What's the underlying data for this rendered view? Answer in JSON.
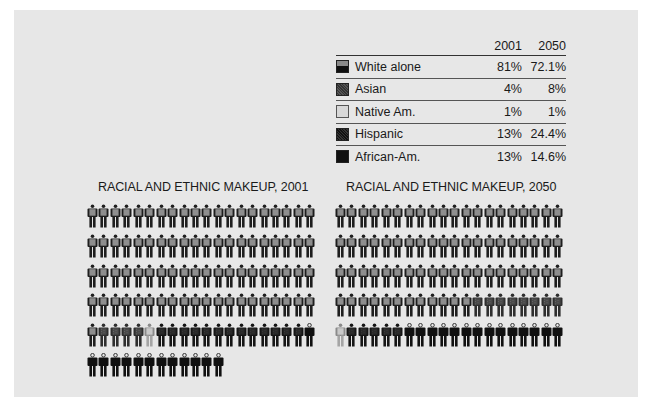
{
  "legend": {
    "columns": [
      "2001",
      "2050"
    ],
    "rows": [
      {
        "key": "white",
        "label": "White alone",
        "v2001": "81%",
        "v2050": "72.1%"
      },
      {
        "key": "asian",
        "label": "Asian",
        "v2001": "4%",
        "v2050": "8%"
      },
      {
        "key": "native",
        "label": "Native Am.",
        "v2001": "1%",
        "v2050": "1%"
      },
      {
        "key": "hispanic",
        "label": "Hispanic",
        "v2001": "13%",
        "v2050": "24.4%"
      },
      {
        "key": "african",
        "label": "African-Am.",
        "v2001": "13%",
        "v2050": "14.6%"
      }
    ]
  },
  "charts": {
    "c2001": {
      "title": "RACIAL AND ETHNIC MAKEUP, 2001"
    },
    "c2050": {
      "title": "RACIAL AND ETHNIC MAKEUP, 2050"
    }
  },
  "colors": {
    "panel": "#e7e7e7",
    "white_torso": "#8e8e8e",
    "white_body": "#1e1e1e",
    "asian": "#4a4a4a",
    "native": "#c9c9c9",
    "hispanic": "#2a2a2a",
    "african": "#111111"
  },
  "chart_data": [
    {
      "type": "pictograph",
      "title": "RACIAL AND ETHNIC MAKEUP, 2001",
      "unit": "1 figure = 1%",
      "figures_per_row": 20,
      "categories": [
        "White alone",
        "Asian",
        "Native Am.",
        "Hispanic",
        "African-Am."
      ],
      "values": [
        81,
        4,
        1,
        13,
        13
      ],
      "sequence": [
        {
          "category": "White alone",
          "count": 81
        },
        {
          "category": "Asian",
          "count": 4
        },
        {
          "category": "Native Am.",
          "count": 1
        },
        {
          "category": "Hispanic",
          "count": 13
        },
        {
          "category": "African-Am.",
          "count": 13
        }
      ]
    },
    {
      "type": "pictograph",
      "title": "RACIAL AND ETHNIC MAKEUP, 2050",
      "unit": "1 figure = 1%",
      "figures_per_row": 20,
      "categories": [
        "White alone",
        "Asian",
        "Native Am.",
        "Hispanic",
        "African-Am."
      ],
      "values": [
        72.1,
        8,
        1,
        24.4,
        14.6
      ],
      "sequence": [
        {
          "category": "White alone",
          "count": 72
        },
        {
          "category": "Asian",
          "count": 8
        },
        {
          "category": "Native Am.",
          "count": 1
        },
        {
          "category": "Hispanic",
          "count": 5
        },
        {
          "category": "African-Am.",
          "count": 14
        }
      ]
    }
  ]
}
